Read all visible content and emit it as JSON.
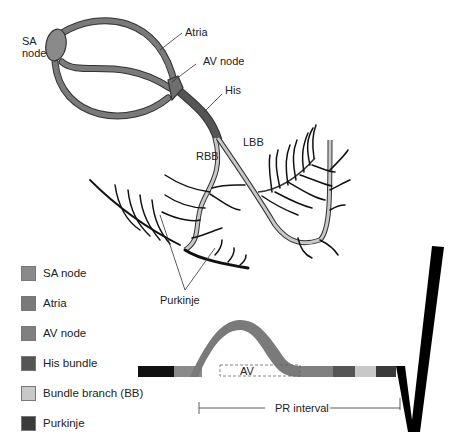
{
  "diagram": {
    "labels": {
      "sa_node": [
        "SA",
        "node"
      ],
      "atria": "Atria",
      "av_node": "AV node",
      "his": "His",
      "rbb": "RBB",
      "lbb": "LBB",
      "purkinje": "Purkinje"
    }
  },
  "legend": {
    "items": [
      {
        "label": "SA node",
        "color": "#8a8a8a"
      },
      {
        "label": "Atria",
        "color": "#7a7a7a"
      },
      {
        "label": "AV node",
        "color": "#808080"
      },
      {
        "label": "His bundle",
        "color": "#555555"
      },
      {
        "label": "Bundle branch (BB)",
        "color": "#c8c8c8"
      },
      {
        "label": "Purkinje",
        "color": "#3a3a3a"
      }
    ]
  },
  "ecg": {
    "segment_label": "AV",
    "interval_label": "PR interval",
    "segments": [
      {
        "name": "baseline",
        "color": "#111111"
      },
      {
        "name": "SA node",
        "color": "#8a8a8a"
      },
      {
        "name": "Atria (P wave)",
        "color": "#7a7a7a"
      },
      {
        "name": "AV node",
        "color": "#808080"
      },
      {
        "name": "His bundle",
        "color": "#555555"
      },
      {
        "name": "Bundle branch",
        "color": "#c8c8c8"
      },
      {
        "name": "Purkinje",
        "color": "#3a3a3a"
      },
      {
        "name": "QRS",
        "color": "#000000"
      }
    ]
  }
}
